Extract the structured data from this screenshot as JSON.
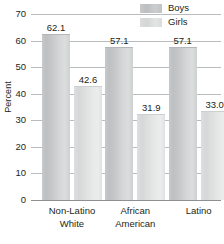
{
  "chart_data": {
    "type": "bar",
    "title": "",
    "xlabel": "",
    "ylabel": "Percent",
    "ylim": [
      0,
      70
    ],
    "ytick_step": 10,
    "yticks": [
      70,
      60,
      50,
      40,
      30,
      20,
      10,
      0
    ],
    "grid": true,
    "legend_position": "top-right",
    "categories": [
      "Non-Latino White",
      "African American",
      "Latino"
    ],
    "category_lines": [
      [
        "Non-Latino",
        "White"
      ],
      [
        "African",
        "American"
      ],
      [
        "Latino",
        ""
      ]
    ],
    "series": [
      {
        "name": "Boys",
        "color": "#c4c6c8",
        "values": [
          62.1,
          57.1,
          57.1
        ],
        "labels": [
          "62.1",
          "57.1",
          "57.1"
        ]
      },
      {
        "name": "Girls",
        "color": "#dedfdf",
        "values": [
          42.6,
          31.9,
          33.0
        ],
        "labels": [
          "42.6",
          "31.9",
          "33.0"
        ]
      }
    ]
  },
  "legend": {
    "items": [
      {
        "label": "Boys"
      },
      {
        "label": "Girls"
      }
    ]
  },
  "axis": {
    "y_title": "Percent",
    "tick_labels": [
      "70",
      "60",
      "50",
      "40",
      "30",
      "20",
      "10",
      "0"
    ]
  },
  "colors": {
    "gridline": "#b9bbbd",
    "axis": "#8e9093",
    "text": "#231f20",
    "bar_boys": "#c4c6c8",
    "bar_girls": "#dedfdf"
  }
}
